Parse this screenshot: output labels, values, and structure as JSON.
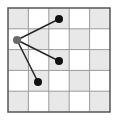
{
  "diagram": {
    "type": "grid-graph",
    "grid": {
      "rows": 5,
      "cols": 5,
      "x0": 8,
      "y0": 8,
      "width": 102,
      "height": 104,
      "pattern": "checkerboard",
      "dark_when_sum_even": true,
      "colors": {
        "dark_cell": "#e8e8e8",
        "light_cell": "#ffffff",
        "grid_line": "#9a9a9a",
        "border": "#555555"
      }
    },
    "nodes": [
      {
        "id": "origin",
        "x": 17,
        "y": 40,
        "r": 4,
        "color": "#6a6a6a"
      },
      {
        "id": "top",
        "x": 59,
        "y": 19,
        "r": 4,
        "color": "#111111"
      },
      {
        "id": "middle",
        "x": 59,
        "y": 61,
        "r": 4,
        "color": "#111111"
      },
      {
        "id": "bottom",
        "x": 38,
        "y": 82,
        "r": 4,
        "color": "#111111"
      }
    ],
    "edges": [
      {
        "from": "origin",
        "to": "top"
      },
      {
        "from": "origin",
        "to": "middle"
      },
      {
        "from": "origin",
        "to": "bottom"
      }
    ],
    "edge_color": "#2a2a2a",
    "edge_width": 1.6
  }
}
